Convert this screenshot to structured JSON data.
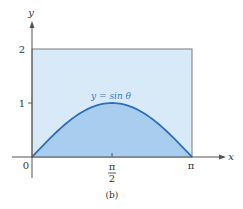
{
  "chart_data": {
    "type": "area",
    "title": "",
    "caption": "(b)",
    "xlabel": "x",
    "ylabel": "y",
    "xlim": [
      0,
      3.14159
    ],
    "ylim": [
      0,
      2
    ],
    "x_ticks": [
      {
        "value": 0,
        "label": "0"
      },
      {
        "value": 1.5708,
        "label_num": "π",
        "label_den": "2"
      },
      {
        "value": 3.14159,
        "label": "π"
      }
    ],
    "y_ticks": [
      {
        "value": 1,
        "label": "1"
      },
      {
        "value": 2,
        "label": "2"
      }
    ],
    "series": [
      {
        "name": "y = sin θ",
        "function": "sin(theta)",
        "x": [
          0,
          0.3927,
          0.7854,
          1.1781,
          1.5708,
          1.9635,
          2.3562,
          2.7489,
          3.14159
        ],
        "values": [
          0,
          0.383,
          0.707,
          0.924,
          1,
          0.924,
          0.707,
          0.383,
          0
        ],
        "fill": "under-curve"
      }
    ],
    "bounding_rectangle": {
      "x0": 0,
      "x1": 3.14159,
      "y0": 0,
      "y1": 2
    },
    "grid": false,
    "legend": "none",
    "annotations": [
      {
        "text": "y = sin θ",
        "x": 1.5708,
        "y": 1.05
      }
    ]
  },
  "labels": {
    "x_axis": "x",
    "y_axis": "y",
    "origin": "0",
    "y_one": "1",
    "y_two": "2",
    "x_half_pi_num": "π",
    "x_half_pi_den": "2",
    "x_pi": "π",
    "curve": "y = sin θ",
    "caption": "(b)"
  },
  "colors": {
    "rect_fill": "#d8eaf8",
    "area_fill": "#a9cdee",
    "curve": "#2f6fb8",
    "axis": "#555555",
    "rect_border": "#7a7a7a",
    "label_curve": "#3a78c0"
  }
}
